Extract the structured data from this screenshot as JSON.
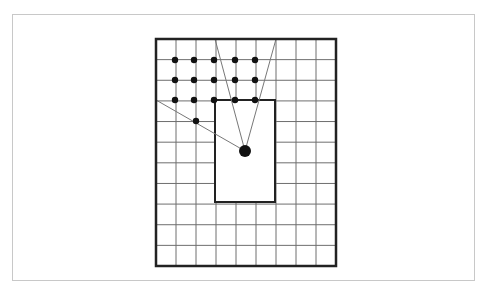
{
  "diagram": {
    "type": "grid-visibility",
    "colors": {
      "background": "#ffffff",
      "frame": "#c8c8c8",
      "grid_line": "#6e6e6e",
      "border": "#222222",
      "sight_line": "#777777",
      "dot": "#111111"
    },
    "outer_grid": {
      "x0": 156,
      "y0": 39,
      "x1": 336,
      "y1": 266,
      "cols": 9,
      "rows": 11
    },
    "obstacle": {
      "x0": 215,
      "y0": 100,
      "x1": 275,
      "y1": 202
    },
    "observer": {
      "x": 245,
      "y": 151,
      "r": 6
    },
    "sight_lines": [
      {
        "x1": 245,
        "y1": 151,
        "x2": 215,
        "y2": 39
      },
      {
        "x1": 245,
        "y1": 151,
        "x2": 276,
        "y2": 39
      },
      {
        "x1": 245,
        "y1": 151,
        "x2": 156,
        "y2": 100
      }
    ],
    "visible_points": [
      {
        "x": 175,
        "y": 60
      },
      {
        "x": 194,
        "y": 60
      },
      {
        "x": 214,
        "y": 60
      },
      {
        "x": 235,
        "y": 60
      },
      {
        "x": 255,
        "y": 60
      },
      {
        "x": 175,
        "y": 80
      },
      {
        "x": 194,
        "y": 80
      },
      {
        "x": 214,
        "y": 80
      },
      {
        "x": 235,
        "y": 80
      },
      {
        "x": 255,
        "y": 80
      },
      {
        "x": 175,
        "y": 100
      },
      {
        "x": 194,
        "y": 100
      },
      {
        "x": 214,
        "y": 100
      },
      {
        "x": 235,
        "y": 100
      },
      {
        "x": 255,
        "y": 100
      },
      {
        "x": 196,
        "y": 121
      }
    ]
  }
}
